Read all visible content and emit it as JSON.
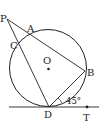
{
  "diagram": {
    "type": "geometry",
    "labels": {
      "P": "P",
      "A": "A",
      "C": "C",
      "O": "O",
      "B": "B",
      "D": "D",
      "T": "T",
      "angle": "45°"
    },
    "elements": [
      "circle O",
      "secant P-A-B",
      "secant P-C-D",
      "chord B-D",
      "tangent line through D and T",
      "angle BDT = 45°"
    ],
    "colors": {
      "stroke": "#222222",
      "background": "#ffffff"
    }
  }
}
